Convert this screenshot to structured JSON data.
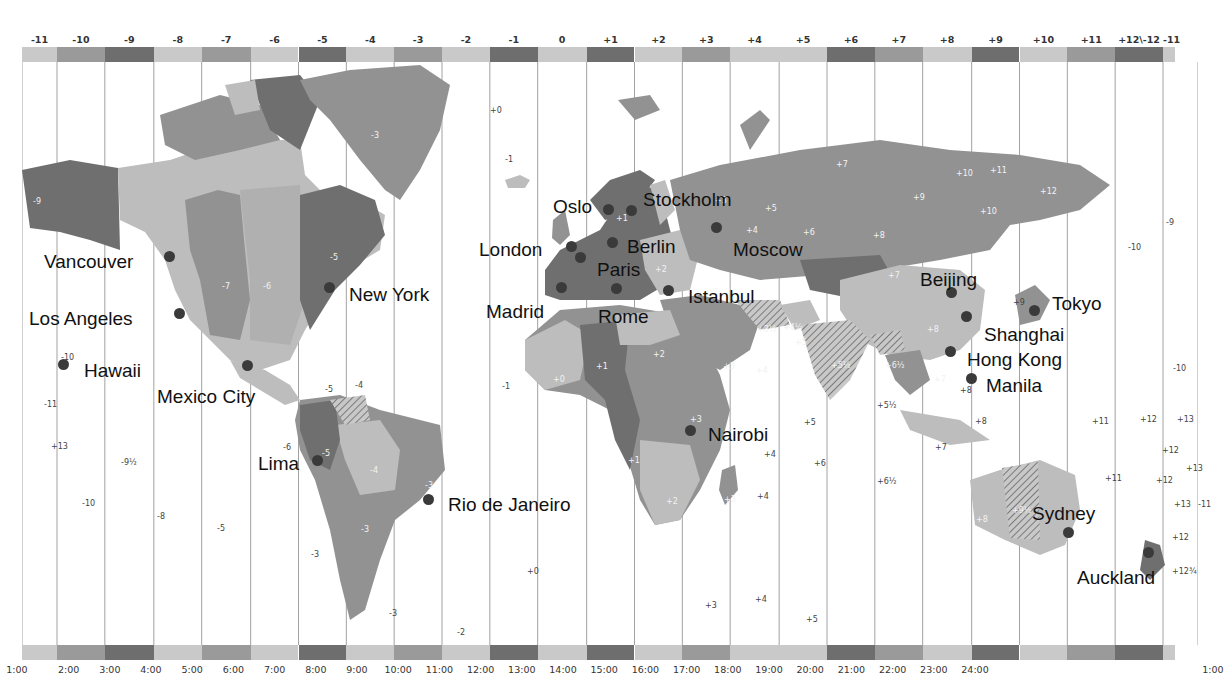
{
  "map": {
    "title": "World Time Zones",
    "colors": {
      "band_light": "#c9c9c9",
      "band_mid": "#9a9a9a",
      "band_dark": "#6e6e6e",
      "land_light": "#bdbdbd",
      "land_mid": "#929292",
      "land_dark": "#6f6f6f",
      "grid_line": "#8a8a8a",
      "city_dot": "#3a3a3a"
    },
    "top_offsets": [
      {
        "label": "-11",
        "x": 22,
        "w": 30,
        "shade": "light"
      },
      {
        "label": "-10",
        "x": 52,
        "w": 41,
        "shade": "mid"
      },
      {
        "label": "-9",
        "x": 93,
        "w": 42,
        "shade": "dark"
      },
      {
        "label": "-8",
        "x": 135,
        "w": 41,
        "shade": "light"
      },
      {
        "label": "-7",
        "x": 176,
        "w": 42,
        "shade": "mid"
      },
      {
        "label": "-6",
        "x": 218,
        "w": 41,
        "shade": "light"
      },
      {
        "label": "-5",
        "x": 259,
        "w": 41,
        "shade": "dark"
      },
      {
        "label": "-4",
        "x": 300,
        "w": 41,
        "shade": "light"
      },
      {
        "label": "-3",
        "x": 341,
        "w": 41,
        "shade": "mid"
      },
      {
        "label": "-2",
        "x": 382,
        "w": 41,
        "shade": "light"
      },
      {
        "label": "-1",
        "x": 423,
        "w": 41,
        "shade": "dark"
      },
      {
        "label": "0",
        "x": 464,
        "w": 42,
        "shade": "light"
      },
      {
        "label": "+1",
        "x": 506,
        "w": 41,
        "shade": "dark"
      },
      {
        "label": "+2",
        "x": 547,
        "w": 41,
        "shade": "light"
      },
      {
        "label": "+3",
        "x": 588,
        "w": 41,
        "shade": "mid"
      },
      {
        "label": "+4",
        "x": 629,
        "w": 42,
        "shade": "light"
      },
      {
        "label": "+5",
        "x": 671,
        "w": 41,
        "shade": "light"
      },
      {
        "label": "+6",
        "x": 712,
        "w": 41,
        "shade": "dark"
      },
      {
        "label": "+7",
        "x": 753,
        "w": 41,
        "shade": "mid"
      },
      {
        "label": "+8",
        "x": 794,
        "w": 42,
        "shade": "light"
      },
      {
        "label": "+9",
        "x": 836,
        "w": 41,
        "shade": "dark"
      },
      {
        "label": "+10",
        "x": 877,
        "w": 41,
        "shade": "light"
      },
      {
        "label": "+11",
        "x": 918,
        "w": 41,
        "shade": "mid"
      },
      {
        "label": "+12\\-12",
        "x": 959,
        "w": 41,
        "shade": "dark"
      },
      {
        "label": "-11",
        "x": 1000,
        "w": 10,
        "shade": "light"
      }
    ],
    "bottom_times": [
      "1:00",
      "2:00",
      "3:00",
      "4:00",
      "5:00",
      "6:00",
      "7:00",
      "8:00",
      "9:00",
      "10:00",
      "11:00",
      "12:00",
      "13:00",
      "14:00",
      "15:00",
      "16:00",
      "17:00",
      "18:00",
      "19:00",
      "20:00",
      "21:00",
      "22:00",
      "23:00",
      "24:00",
      "1:00"
    ],
    "cities": [
      {
        "name": "Vancouver",
        "lx": 44,
        "ly": 252,
        "dx": 169,
        "dy": 256
      },
      {
        "name": "Los Angeles",
        "lx": 29,
        "ly": 309,
        "dx": 179,
        "dy": 313
      },
      {
        "name": "Hawaii",
        "lx": 84,
        "ly": 361,
        "dx": 63,
        "dy": 364
      },
      {
        "name": "Mexico City",
        "lx": 157,
        "ly": 387,
        "dx": 247,
        "dy": 365
      },
      {
        "name": "New York",
        "lx": 349,
        "ly": 285,
        "dx": 329,
        "dy": 287
      },
      {
        "name": "Lima",
        "lx": 258,
        "ly": 454,
        "dx": 317,
        "dy": 460
      },
      {
        "name": "Rio de Janeiro",
        "lx": 448,
        "ly": 495,
        "dx": 428,
        "dy": 499
      },
      {
        "name": "Oslo",
        "lx": 553,
        "ly": 197,
        "dx": 608,
        "dy": 209
      },
      {
        "name": "Stockholm",
        "lx": 643,
        "ly": 190,
        "dx": 631,
        "dy": 210
      },
      {
        "name": "London",
        "lx": 479,
        "ly": 240,
        "dx": 571,
        "dy": 246
      },
      {
        "name": "Berlin",
        "lx": 627,
        "ly": 237,
        "dx": 612,
        "dy": 242
      },
      {
        "name": "Paris",
        "lx": 597,
        "ly": 260,
        "dx": 580,
        "dy": 257
      },
      {
        "name": "Madrid",
        "lx": 486,
        "ly": 302,
        "dx": 561,
        "dy": 287
      },
      {
        "name": "Rome",
        "lx": 598,
        "ly": 307,
        "dx": 616,
        "dy": 288
      },
      {
        "name": "Istanbul",
        "lx": 688,
        "ly": 287,
        "dx": 668,
        "dy": 290
      },
      {
        "name": "Moscow",
        "lx": 733,
        "ly": 240,
        "dx": 716,
        "dy": 227
      },
      {
        "name": "Beijing",
        "lx": 920,
        "ly": 270,
        "dx": 951,
        "dy": 292
      },
      {
        "name": "Tokyo",
        "lx": 1052,
        "ly": 294,
        "dx": 1034,
        "dy": 310
      },
      {
        "name": "Shanghai",
        "lx": 984,
        "ly": 325,
        "dx": 966,
        "dy": 316
      },
      {
        "name": "Hong Kong",
        "lx": 967,
        "ly": 350,
        "dx": 950,
        "dy": 351
      },
      {
        "name": "Manila",
        "lx": 986,
        "ly": 376,
        "dx": 971,
        "dy": 378
      },
      {
        "name": "Nairobi",
        "lx": 708,
        "ly": 425,
        "dx": 690,
        "dy": 430
      },
      {
        "name": "Sydney",
        "lx": 1032,
        "ly": 504,
        "dx": 1068,
        "dy": 532
      },
      {
        "name": "Auckland",
        "lx": 1077,
        "ly": 568,
        "dx": 1148,
        "dy": 552
      }
    ],
    "zone_numbers": [
      {
        "t": "-9",
        "x": 33,
        "y": 197,
        "w": true
      },
      {
        "t": "-10",
        "x": 61,
        "y": 353,
        "w": false
      },
      {
        "t": "-11",
        "x": 44,
        "y": 400,
        "w": false
      },
      {
        "t": "+13",
        "x": 51,
        "y": 442,
        "w": false
      },
      {
        "t": "-9½",
        "x": 121,
        "y": 458,
        "w": false
      },
      {
        "t": "-10",
        "x": 82,
        "y": 499,
        "w": false
      },
      {
        "t": "-8",
        "x": 157,
        "y": 512,
        "w": false
      },
      {
        "t": "-5",
        "x": 217,
        "y": 524,
        "w": false
      },
      {
        "t": "-6",
        "x": 283,
        "y": 443,
        "w": false
      },
      {
        "t": "-3",
        "x": 311,
        "y": 550,
        "w": false
      },
      {
        "t": "-7",
        "x": 222,
        "y": 282,
        "w": true
      },
      {
        "t": "-6",
        "x": 263,
        "y": 282,
        "w": true
      },
      {
        "t": "-5",
        "x": 330,
        "y": 253,
        "w": true
      },
      {
        "t": "-5",
        "x": 325,
        "y": 385,
        "w": false
      },
      {
        "t": "-4",
        "x": 355,
        "y": 381,
        "w": false
      },
      {
        "t": "-5",
        "x": 322,
        "y": 449,
        "w": true
      },
      {
        "t": "-4",
        "x": 370,
        "y": 466,
        "w": true
      },
      {
        "t": "-3",
        "x": 425,
        "y": 481,
        "w": true
      },
      {
        "t": "-3",
        "x": 361,
        "y": 525,
        "w": true
      },
      {
        "t": "-3",
        "x": 389,
        "y": 609,
        "w": false
      },
      {
        "t": "-2",
        "x": 457,
        "y": 628,
        "w": false
      },
      {
        "t": "-3",
        "x": 371,
        "y": 131,
        "w": true
      },
      {
        "t": "+0",
        "x": 490,
        "y": 106,
        "w": false
      },
      {
        "t": "-1",
        "x": 505,
        "y": 155,
        "w": false
      },
      {
        "t": "-1",
        "x": 502,
        "y": 382,
        "w": false
      },
      {
        "t": "+0",
        "x": 527,
        "y": 567,
        "w": false
      },
      {
        "t": "+0",
        "x": 553,
        "y": 375,
        "w": true
      },
      {
        "t": "+1",
        "x": 596,
        "y": 362,
        "w": true
      },
      {
        "t": "+1",
        "x": 628,
        "y": 456,
        "w": true
      },
      {
        "t": "+2",
        "x": 653,
        "y": 350,
        "w": true
      },
      {
        "t": "+2",
        "x": 666,
        "y": 497,
        "w": true
      },
      {
        "t": "+3",
        "x": 723,
        "y": 362,
        "w": true
      },
      {
        "t": "+3",
        "x": 690,
        "y": 415,
        "w": true
      },
      {
        "t": "+3",
        "x": 724,
        "y": 495,
        "w": true
      },
      {
        "t": "+4",
        "x": 756,
        "y": 366,
        "w": true
      },
      {
        "t": "+4",
        "x": 764,
        "y": 450,
        "w": false
      },
      {
        "t": "+4",
        "x": 757,
        "y": 492,
        "w": false
      },
      {
        "t": "+4",
        "x": 755,
        "y": 595,
        "w": false
      },
      {
        "t": "+3",
        "x": 705,
        "y": 601,
        "w": false
      },
      {
        "t": "+5",
        "x": 804,
        "y": 418,
        "w": false
      },
      {
        "t": "+5",
        "x": 806,
        "y": 615,
        "w": false
      },
      {
        "t": "+6",
        "x": 814,
        "y": 459,
        "w": false
      },
      {
        "t": "+3½",
        "x": 757,
        "y": 325,
        "w": true
      },
      {
        "t": "+4½",
        "x": 783,
        "y": 323,
        "w": true
      },
      {
        "t": "+5",
        "x": 795,
        "y": 338,
        "w": true
      },
      {
        "t": "+5½",
        "x": 831,
        "y": 361,
        "w": true
      },
      {
        "t": "+6½",
        "x": 885,
        "y": 361,
        "w": true
      },
      {
        "t": "+5½",
        "x": 877,
        "y": 401,
        "w": false
      },
      {
        "t": "+6½",
        "x": 877,
        "y": 477,
        "w": false
      },
      {
        "t": "+7",
        "x": 934,
        "y": 375,
        "w": true
      },
      {
        "t": "+7",
        "x": 935,
        "y": 443,
        "w": false
      },
      {
        "t": "+8",
        "x": 927,
        "y": 325,
        "w": true
      },
      {
        "t": "+8",
        "x": 960,
        "y": 386,
        "w": false
      },
      {
        "t": "+8",
        "x": 975,
        "y": 417,
        "w": false
      },
      {
        "t": "+8",
        "x": 976,
        "y": 515,
        "w": true
      },
      {
        "t": "+9½",
        "x": 1012,
        "y": 506,
        "w": true
      },
      {
        "t": "+9",
        "x": 1013,
        "y": 298,
        "w": false
      },
      {
        "t": "+7",
        "x": 888,
        "y": 271,
        "w": true
      },
      {
        "t": "+7",
        "x": 836,
        "y": 160,
        "w": true
      },
      {
        "t": "+5",
        "x": 765,
        "y": 204,
        "w": true
      },
      {
        "t": "+3",
        "x": 715,
        "y": 196,
        "w": true
      },
      {
        "t": "+4",
        "x": 746,
        "y": 226,
        "w": true
      },
      {
        "t": "+6",
        "x": 803,
        "y": 228,
        "w": true
      },
      {
        "t": "+8",
        "x": 873,
        "y": 231,
        "w": true
      },
      {
        "t": "+9",
        "x": 913,
        "y": 193,
        "w": true
      },
      {
        "t": "+10",
        "x": 956,
        "y": 169,
        "w": true
      },
      {
        "t": "+11",
        "x": 990,
        "y": 166,
        "w": true
      },
      {
        "t": "+10",
        "x": 980,
        "y": 207,
        "w": true
      },
      {
        "t": "+12",
        "x": 1040,
        "y": 187,
        "w": true
      },
      {
        "t": "+1",
        "x": 616,
        "y": 214,
        "w": true
      },
      {
        "t": "+2",
        "x": 655,
        "y": 265,
        "w": true
      },
      {
        "t": "-9",
        "x": 1166,
        "y": 218,
        "w": false
      },
      {
        "t": "-10",
        "x": 1128,
        "y": 243,
        "w": false
      },
      {
        "t": "-10",
        "x": 1173,
        "y": 364,
        "w": false
      },
      {
        "t": "+11",
        "x": 1092,
        "y": 417,
        "w": false
      },
      {
        "t": "+12",
        "x": 1140,
        "y": 415,
        "w": false
      },
      {
        "t": "+13",
        "x": 1177,
        "y": 415,
        "w": false
      },
      {
        "t": "+12",
        "x": 1162,
        "y": 446,
        "w": false
      },
      {
        "t": "+13",
        "x": 1186,
        "y": 464,
        "w": false
      },
      {
        "t": "+11",
        "x": 1105,
        "y": 474,
        "w": false
      },
      {
        "t": "+12",
        "x": 1156,
        "y": 476,
        "w": false
      },
      {
        "t": "+13",
        "x": 1174,
        "y": 500,
        "w": false
      },
      {
        "t": "-11",
        "x": 1198,
        "y": 500,
        "w": false
      },
      {
        "t": "+12",
        "x": 1172,
        "y": 533,
        "w": false
      },
      {
        "t": "+12¾",
        "x": 1172,
        "y": 567,
        "w": false
      }
    ]
  }
}
